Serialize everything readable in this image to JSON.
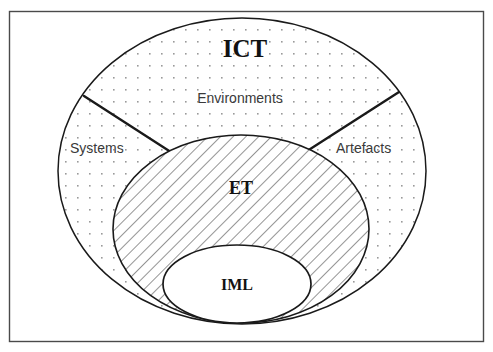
{
  "diagram": {
    "title_visible": false,
    "frame": {
      "name": "outer-border-frame",
      "stroke": "#4a4a4a",
      "fill": "#ffffff",
      "x": 9,
      "y": 11,
      "width": 475,
      "height": 331
    },
    "colors": {
      "outline": "#1a1a1a",
      "frame_border": "#4a4a4a",
      "dot_fill": "#9a9a9a",
      "hatch_line": "#3d3d3d",
      "background": "#ffffff",
      "serif_text": "#111111",
      "sans_text": "#3a3a3a"
    },
    "regions": [
      {
        "name": "outer-ellipse-ict",
        "label": "ICT",
        "label_style": "serif-bold",
        "label_size": 25,
        "fill_pattern": "dots",
        "cx": 242,
        "cy": 171,
        "rx": 184,
        "ry": 153,
        "label_x": 245,
        "label_y": 57
      },
      {
        "name": "middle-ellipse-et",
        "label": "ET",
        "label_style": "serif-bold",
        "label_size": 18,
        "fill_pattern": "diagonal-hatch",
        "cx": 241,
        "cy": 229,
        "rx": 128,
        "ry": 94,
        "label_x": 241,
        "label_y": 194
      },
      {
        "name": "inner-ellipse-iml",
        "label": "IML",
        "label_style": "serif-bold",
        "label_size": 16,
        "fill_pattern": "solid-white",
        "cx": 237,
        "cy": 284,
        "rx": 74,
        "ry": 39,
        "label_x": 237,
        "label_y": 290
      }
    ],
    "segment_labels": [
      {
        "name": "segment-label-environments",
        "text": "Environments",
        "x": 240,
        "y": 103,
        "anchor": "middle",
        "size": 14
      },
      {
        "name": "segment-label-systems",
        "text": "Systems",
        "x": 70,
        "y": 153,
        "anchor": "start",
        "size": 14
      },
      {
        "name": "segment-label-artefacts",
        "text": "Artefacts",
        "x": 336,
        "y": 153,
        "anchor": "start",
        "size": 14
      }
    ],
    "divider_lines": [
      {
        "name": "divider-line-left",
        "x1": 84,
        "y1": 96,
        "x2": 177,
        "y2": 156
      },
      {
        "name": "divider-line-right",
        "x1": 399,
        "y1": 92,
        "x2": 304,
        "y2": 153
      }
    ]
  }
}
